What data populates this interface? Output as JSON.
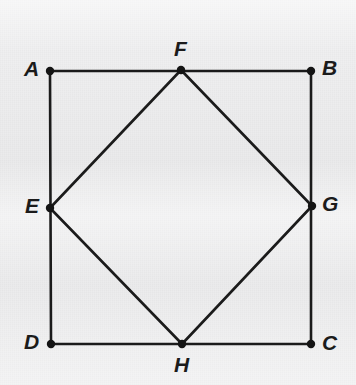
{
  "figure": {
    "name": "square-with-inscribed-square",
    "canvas": {
      "width": 356,
      "height": 385
    },
    "background_color": "#efeff0",
    "stroke_color": "#1b1b1b",
    "stroke_width": 2.6,
    "vertex_dot_color": "#141414",
    "vertex_dot_radius": 4.2,
    "label_color": "#1b1b1b"
  },
  "points": {
    "A": {
      "label": "A",
      "x": 50,
      "y": 71,
      "label_x": 24,
      "label_y": 58
    },
    "B": {
      "label": "B",
      "x": 311,
      "y": 71,
      "label_x": 322,
      "label_y": 57
    },
    "C": {
      "label": "C",
      "x": 311,
      "y": 344,
      "label_x": 322,
      "label_y": 332
    },
    "D": {
      "label": "D",
      "x": 51,
      "y": 344,
      "label_x": 24,
      "label_y": 331
    },
    "E": {
      "label": "E",
      "x": 50,
      "y": 208,
      "label_x": 25,
      "label_y": 195
    },
    "F": {
      "label": "F",
      "x": 181,
      "y": 70,
      "label_x": 174,
      "label_y": 38
    },
    "G": {
      "label": "G",
      "x": 312,
      "y": 206,
      "label_x": 322,
      "label_y": 193
    },
    "H": {
      "label": "H",
      "x": 182,
      "y": 344,
      "label_x": 174,
      "label_y": 354
    }
  },
  "shapes": {
    "outer_square": {
      "name": "square-ABCD",
      "vertices": [
        "A",
        "B",
        "C",
        "D"
      ]
    },
    "inner_square": {
      "name": "square-EFGH",
      "vertices": [
        "E",
        "F",
        "G",
        "H"
      ]
    }
  },
  "segments": [
    {
      "name": "segment-AB",
      "from": "A",
      "to": "B"
    },
    {
      "name": "segment-BC",
      "from": "B",
      "to": "C"
    },
    {
      "name": "segment-CD",
      "from": "C",
      "to": "D"
    },
    {
      "name": "segment-DA",
      "from": "D",
      "to": "A"
    },
    {
      "name": "segment-EF",
      "from": "E",
      "to": "F"
    },
    {
      "name": "segment-FG",
      "from": "F",
      "to": "G"
    },
    {
      "name": "segment-GH",
      "from": "G",
      "to": "H"
    },
    {
      "name": "segment-HE",
      "from": "H",
      "to": "E"
    }
  ],
  "vertex_order": [
    "A",
    "B",
    "C",
    "D",
    "E",
    "F",
    "G",
    "H"
  ]
}
